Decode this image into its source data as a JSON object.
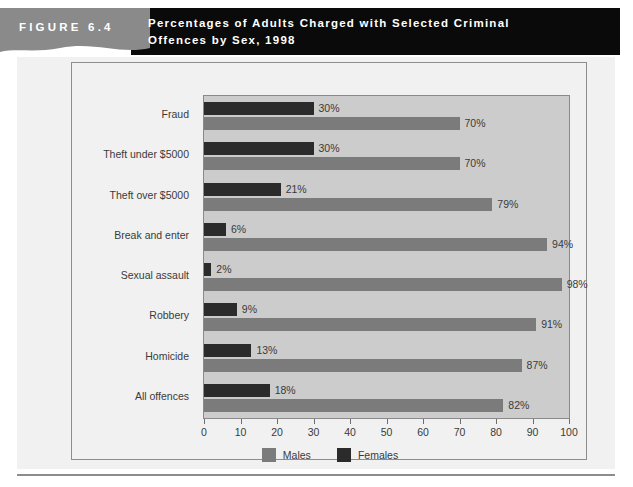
{
  "header": {
    "figure_number": "FIGURE  6.4",
    "title_line1": "Percentages of Adults Charged with Selected Criminal",
    "title_line2": "Offences by Sex, 1998",
    "band_gray": "#8a8a8a",
    "band_black": "#0a0a0a"
  },
  "legend": {
    "items": [
      {
        "label": "Males",
        "color": "#7b7b7b"
      },
      {
        "label": "Females",
        "color": "#2b2b2b"
      }
    ]
  },
  "chart_data": {
    "type": "bar",
    "orientation": "horizontal",
    "title": "Percentages of Adults Charged with Selected Criminal Offences by Sex, 1998",
    "xlabel": "",
    "ylabel": "",
    "xlim": [
      0,
      100
    ],
    "xticks": [
      0,
      10,
      20,
      30,
      40,
      50,
      60,
      70,
      80,
      90,
      100
    ],
    "xtick_labels": [
      "0",
      "10",
      "20",
      "30",
      "40",
      "50",
      "60",
      "70",
      "80",
      "90",
      "100"
    ],
    "grid": false,
    "legend_position": "bottom",
    "categories": [
      "Fraud",
      "Theft under $5000",
      "Theft over $5000",
      "Break and enter",
      "Sexual assault",
      "Robbery",
      "Homicide",
      "All offences"
    ],
    "series": [
      {
        "name": "Females",
        "color": "#2b2b2b",
        "values": [
          30,
          30,
          21,
          6,
          2,
          9,
          13,
          18
        ],
        "data_labels": [
          "30%",
          "30%",
          "21%",
          "6%",
          "2%",
          "9%",
          "13%",
          "18%"
        ]
      },
      {
        "name": "Males",
        "color": "#7b7b7b",
        "values": [
          70,
          70,
          79,
          94,
          98,
          91,
          87,
          82
        ],
        "data_labels": [
          "70%",
          "70%",
          "79%",
          "94%",
          "98%",
          "91%",
          "87%",
          "82%"
        ]
      }
    ],
    "plot_background": "#cccccc"
  }
}
